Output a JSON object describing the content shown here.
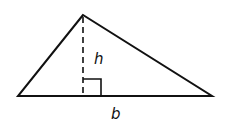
{
  "diagram": {
    "type": "triangle-area",
    "labels": {
      "height": "h",
      "base": "b"
    },
    "points": {
      "apex": [
        83,
        15
      ],
      "left": [
        18,
        96
      ],
      "right": [
        212,
        96
      ],
      "foot": [
        83,
        96
      ]
    },
    "colors": {
      "stroke": "#111111",
      "background": "#ffffff"
    }
  }
}
